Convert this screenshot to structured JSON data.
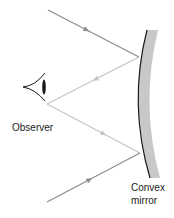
{
  "diagram": {
    "labels": {
      "observer": "Observer",
      "mirror_line1": "Convex",
      "mirror_line2": "mirror"
    },
    "colors": {
      "background": "#ffffff",
      "incident_ray": "#8c8c8c",
      "reflected_ray": "#c4c4c4",
      "mirror_fill": "#c8c8c8",
      "mirror_edge": "#1a1a1a",
      "eye": "#1a1a1a",
      "text": "#1a1a1a"
    },
    "rays": [
      {
        "name": "incident-ray-top",
        "type": "incident",
        "from": [
          48,
          10
        ],
        "to": [
          139,
          57
        ],
        "arrow_direction": "toward-mirror"
      },
      {
        "name": "reflected-ray-top",
        "type": "reflected",
        "from": [
          139,
          57
        ],
        "to": [
          47,
          104
        ],
        "arrow_direction": "toward-observer"
      },
      {
        "name": "reflected-ray-bottom",
        "type": "reflected",
        "from": [
          47,
          104
        ],
        "to": [
          140,
          153
        ],
        "arrow_direction": "toward-mirror"
      },
      {
        "name": "incident-ray-bottom",
        "type": "incident",
        "from": [
          47,
          202
        ],
        "to": [
          140,
          153
        ],
        "arrow_direction": "toward-mirror"
      }
    ],
    "elements": [
      "observer-eye",
      "convex-mirror"
    ]
  }
}
